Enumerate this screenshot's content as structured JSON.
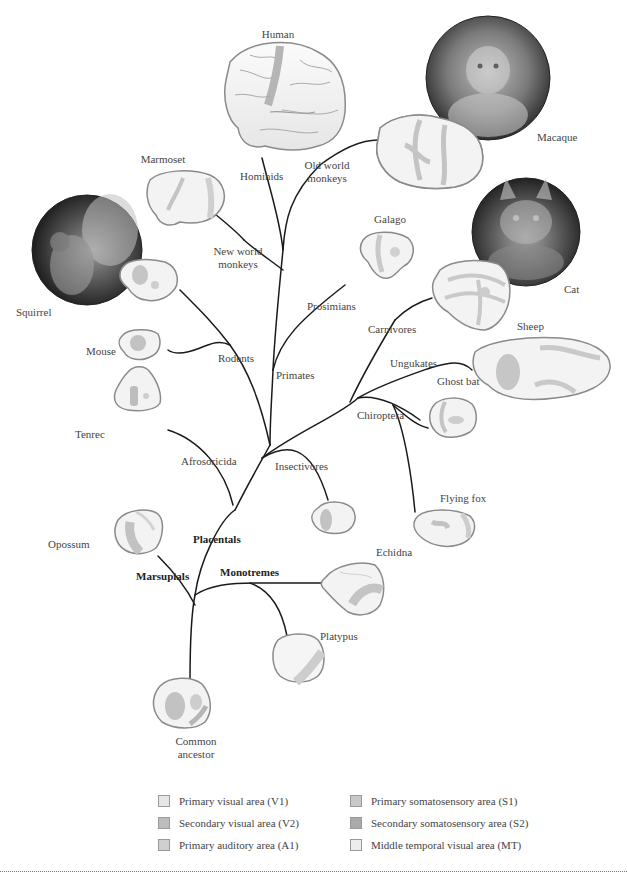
{
  "diagram": {
    "species": [
      {
        "id": "human",
        "label": "Human"
      },
      {
        "id": "macaque",
        "label": "Macaque"
      },
      {
        "id": "marmoset",
        "label": "Marmoset"
      },
      {
        "id": "galago",
        "label": "Galago"
      },
      {
        "id": "cat",
        "label": "Cat"
      },
      {
        "id": "squirrel",
        "label": "Squirrel"
      },
      {
        "id": "sheep",
        "label": "Sheep"
      },
      {
        "id": "mouse",
        "label": "Mouse"
      },
      {
        "id": "tenrec",
        "label": "Tenrec"
      },
      {
        "id": "ghost_bat",
        "label": "Ghost bat"
      },
      {
        "id": "flying_fox",
        "label": "Flying fox"
      },
      {
        "id": "opossum",
        "label": "Opossum"
      },
      {
        "id": "echidna",
        "label": "Echidna"
      },
      {
        "id": "platypus",
        "label": "Platypus"
      },
      {
        "id": "common_ancestor",
        "label_line1": "Common",
        "label_line2": "ancestor"
      }
    ],
    "clades": {
      "hominids": "Hominids",
      "old_world_1": "Old world",
      "old_world_2": "monkeys",
      "new_world_1": "New world",
      "new_world_2": "monkeys",
      "prosimians": "Prosimians",
      "carnivores": "Carnivores",
      "ungukates": "Ungukates",
      "rodents": "Rodents",
      "primates": "Primates",
      "chiroptera": "Chiroptera",
      "afrosoricida": "Afrosoricida",
      "insectivores": "Insectivores",
      "placentals": "Placentals",
      "marsupials": "Marsupials",
      "monotremes": "Monotremes"
    },
    "photos": [
      {
        "id": "macaque-photo",
        "subject": "Macaque"
      },
      {
        "id": "cat-photo",
        "subject": "Cat"
      },
      {
        "id": "squirrel-photo",
        "subject": "Squirrel"
      }
    ]
  },
  "legend": {
    "items": [
      {
        "label": "Primary visual area (V1)",
        "color": "#e6e6e6"
      },
      {
        "label": "Secondary visual area (V2)",
        "color": "#bdbdbd"
      },
      {
        "label": "Primary auditory area (A1)",
        "color": "#cfcfcf"
      },
      {
        "label": "Primary somatosensory area (S1)",
        "color": "#c9c9c9"
      },
      {
        "label": "Secondary somatosensory area (S2)",
        "color": "#aaaaaa"
      },
      {
        "label": "Middle temporal visual area (MT)",
        "color": "#ededed"
      }
    ]
  },
  "colors": {
    "brain_fill": "#f4f4f4",
    "brain_stroke": "#9a9a9a",
    "area_dark": "#bdbdbd",
    "area_mid": "#d2d2d2",
    "branch": "#1a1a1a"
  }
}
